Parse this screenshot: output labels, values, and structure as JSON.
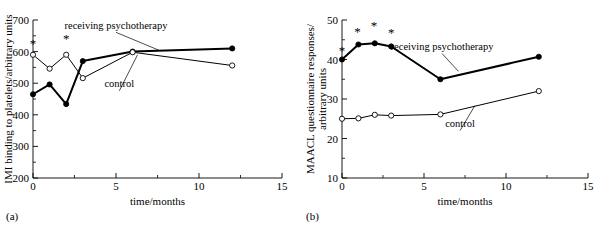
{
  "figure": {
    "panel_a_tag": "(a)",
    "panel_b_tag": "(b)"
  },
  "chart_data": [
    {
      "type": "line",
      "panel": "(a)",
      "title": "",
      "xlabel": "time/months",
      "ylabel": "IMI binding to platelets/arbitrary units",
      "xlim": [
        0,
        15
      ],
      "ylim": [
        200,
        700
      ],
      "xticks": [
        0,
        5,
        10,
        15
      ],
      "xticklabels": [
        "0",
        "5",
        "10",
        "15"
      ],
      "yticks": [
        200,
        300,
        400,
        500,
        600,
        700
      ],
      "yticklabels": [
        "200",
        "300",
        "400",
        "500",
        "600",
        "700"
      ],
      "minor_xtick_step": 2.5,
      "minor_ytick_step": 50,
      "grid": false,
      "legend": "inline-annotations",
      "x": [
        0,
        1,
        2,
        3,
        6,
        12
      ],
      "series": [
        {
          "name": "receiving psychotherapy",
          "marker": "filled-circle",
          "linewidth": 2,
          "values": [
            465,
            496,
            434,
            570,
            600,
            610
          ]
        },
        {
          "name": "control",
          "marker": "open-circle",
          "linewidth": 1,
          "values": [
            590,
            546,
            590,
            516,
            598,
            556
          ]
        }
      ],
      "annotations": [
        {
          "label": "receiving psychotherapy",
          "text_x": 5.0,
          "text_y": 672,
          "leader_to_x": 7.6,
          "leader_to_y": 604
        },
        {
          "label": "control",
          "text_x": 5.2,
          "text_y": 487,
          "leader_to_x": 6.3,
          "leader_to_y": 590
        }
      ],
      "significance_markers": {
        "symbol": "*",
        "points": [
          {
            "x": 0,
            "y": 625
          },
          {
            "x": 2,
            "y": 641
          }
        ]
      }
    },
    {
      "type": "line",
      "panel": "(b)",
      "title": "",
      "xlabel": "time/months",
      "ylabel": "MAACL questionnaire responses/ arbitrary units",
      "ylabel_line1": "MAACL questionnaire responses/",
      "ylabel_line2": "arbitrary units",
      "xlim": [
        0,
        15
      ],
      "ylim": [
        10,
        50
      ],
      "xticks": [
        0,
        5,
        10,
        15
      ],
      "xticklabels": [
        "0",
        "5",
        "10",
        "15"
      ],
      "yticks": [
        10,
        20,
        30,
        40,
        50
      ],
      "yticklabels": [
        "10",
        "20",
        "30",
        "40",
        "50"
      ],
      "minor_xtick_step": 2.5,
      "minor_ytick_step": 5,
      "grid": false,
      "legend": "inline-annotations",
      "x": [
        0,
        1,
        2,
        3,
        6,
        12
      ],
      "series": [
        {
          "name": "receiving psychotherapy",
          "marker": "filled-circle",
          "linewidth": 2,
          "values": [
            40.0,
            43.8,
            44.1,
            43.3,
            35.0,
            40.7
          ]
        },
        {
          "name": "control",
          "marker": "open-circle",
          "linewidth": 1,
          "values": [
            25.0,
            25.1,
            26.0,
            25.8,
            26.1,
            32.0
          ]
        }
      ],
      "annotations": [
        {
          "label": "receiving psychotherapy",
          "text_x": 6.1,
          "text_y": 42.4,
          "leader_to_x": 7.1,
          "leader_to_y": 37.0
        },
        {
          "label": "control",
          "text_x": 7.2,
          "text_y": 22.9,
          "leader_to_x": 8.1,
          "leader_to_y": 28.3
        }
      ],
      "significance_markers": {
        "symbol": "*",
        "points": [
          {
            "x": 0.0,
            "y": 42.1
          },
          {
            "x": 0.95,
            "y": 46.9
          },
          {
            "x": 1.95,
            "y": 48.6
          },
          {
            "x": 3.0,
            "y": 46.7
          }
        ]
      }
    }
  ]
}
